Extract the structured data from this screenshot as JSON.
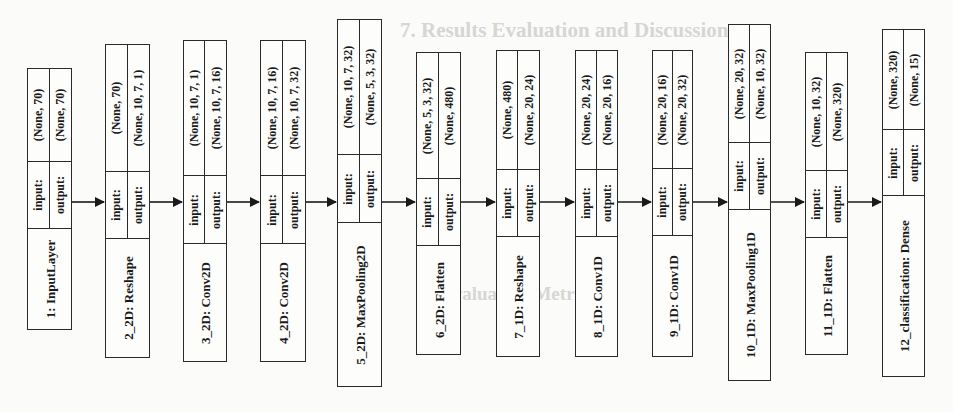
{
  "background_text": {
    "heading": "7. Results Evaluation and Discussion",
    "subheading": "Evaluation Metrics"
  },
  "diagram": {
    "type": "keras-model-plot",
    "orientation": "rotated-90-ccw",
    "io_labels": {
      "input": "input:",
      "output": "output:"
    },
    "layers": [
      {
        "name": "1: InputLayer",
        "input": "(None, 70)",
        "output": "(None, 70)"
      },
      {
        "name": "2_2D: Reshape",
        "input": "(None, 70)",
        "output": "(None, 10, 7, 1)"
      },
      {
        "name": "3_2D: Conv2D",
        "input": "(None, 10, 7, 1)",
        "output": "(None, 10, 7, 16)"
      },
      {
        "name": "4_2D: Conv2D",
        "input": "(None, 10, 7, 16)",
        "output": "(None, 10, 7, 32)"
      },
      {
        "name": "5_2D: MaxPooling2D",
        "input": "(None, 10, 7, 32)",
        "output": "(None, 5, 3, 32)"
      },
      {
        "name": "6_2D: Flatten",
        "input": "(None, 5, 3, 32)",
        "output": "(None, 480)"
      },
      {
        "name": "7_1D: Reshape",
        "input": "(None, 480)",
        "output": "(None, 20, 24)"
      },
      {
        "name": "8_1D: Conv1D",
        "input": "(None, 20, 24)",
        "output": "(None, 20, 16)"
      },
      {
        "name": "9_1D: Conv1D",
        "input": "(None, 20, 16)",
        "output": "(None, 20, 32)"
      },
      {
        "name": "10_1D: MaxPooling1D",
        "input": "(None, 20, 32)",
        "output": "(None, 10, 32)"
      },
      {
        "name": "11_1D: Flatten",
        "input": "(None, 10, 32)",
        "output": "(None, 320)"
      },
      {
        "name": "12_classification: Dense",
        "input": "(None, 320)",
        "output": "(None, 15)"
      }
    ]
  }
}
